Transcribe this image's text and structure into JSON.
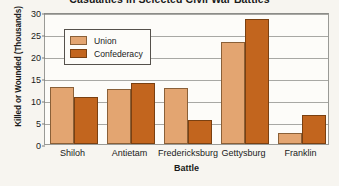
{
  "chart_data": {
    "type": "bar",
    "title": "Casualties in Selected Civil War Battles",
    "xlabel": "Battle",
    "ylabel": "Killed or Wounded (Thousands)",
    "categories": [
      "Shiloh",
      "Antietam",
      "Fredericksburg",
      "Gettysburg",
      "Franklin"
    ],
    "series": [
      {
        "name": "Union",
        "color": "#e3a571",
        "values": [
          13.0,
          12.4,
          12.7,
          23.1,
          2.4
        ]
      },
      {
        "name": "Confederacy",
        "color": "#c2651e",
        "values": [
          10.7,
          13.8,
          5.5,
          28.3,
          6.5
        ]
      }
    ],
    "ylim": [
      0,
      30
    ],
    "yticks": [
      0,
      5,
      10,
      15,
      20,
      25,
      30
    ],
    "ytick_labels": [
      "0",
      "5",
      "10",
      "15",
      "20",
      "25",
      "30"
    ],
    "grid": true,
    "legend_position": "upper-left-inside"
  },
  "legend": {
    "entries": [
      {
        "label": "Union"
      },
      {
        "label": "Confederacy"
      }
    ]
  },
  "colors": {
    "union": "#e3a571",
    "confederacy": "#c2651e",
    "background": "#f7f5f0",
    "plot_background": "#fdfcf9",
    "gridline": "#a8a8a4",
    "text": "#1a1a1a"
  }
}
